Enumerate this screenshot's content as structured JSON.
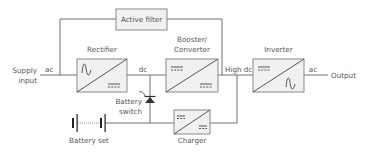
{
  "diagram": {
    "nodes": {
      "active_filter": {
        "label": "Active filter"
      },
      "rectifier": {
        "label": "Rectifier",
        "input_symbol": "sine",
        "output_symbol": "dc"
      },
      "booster": {
        "label_line1": "Booster/",
        "label_line2": "Converter",
        "input_symbol": "dc",
        "output_symbol": "dc"
      },
      "inverter": {
        "label": "Inverter",
        "input_symbol": "dc",
        "output_symbol": "sine"
      },
      "charger": {
        "label": "Charger",
        "input_symbol": "dc",
        "output_symbol": "dc"
      },
      "battery_switch": {
        "label_line1": "Battery",
        "label_line2": "switch",
        "icon": "diode-icon"
      },
      "battery_set": {
        "label": "Battery set",
        "icon": "battery-icon"
      }
    },
    "terminals": {
      "supply_input_line1": "Supply",
      "supply_input_line2": "input",
      "output": "Output"
    },
    "edge_labels": {
      "input_ac": "ac",
      "rectifier_dc": "dc",
      "high_dc": "High dc",
      "output_ac": "ac"
    },
    "colors": {
      "box_fill": "#f1f1f1",
      "box_stroke": "#8a8a8a",
      "wire": "#6f6f6f",
      "text": "#555555"
    }
  }
}
